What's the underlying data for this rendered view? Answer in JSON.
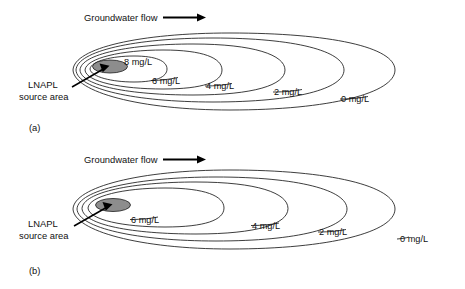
{
  "figure": {
    "type": "diagram",
    "background_color": "#ffffff",
    "line_color": "#1b1b1b",
    "source_fill_color": "#8d8d8d",
    "panels": [
      {
        "letter": "(a)",
        "flow_label": "Groundwater flow",
        "source_label_line1": "LNAPL",
        "source_label_line2": "source area",
        "contours": [
          {
            "label": "8 mg/L",
            "value": 8,
            "unit": "mg/L"
          },
          {
            "label": "6 mg/L",
            "value": 6,
            "unit": "mg/L"
          },
          {
            "label": "4 mg/L",
            "value": 4,
            "unit": "mg/L"
          },
          {
            "label": "2 mg/L",
            "value": 2,
            "unit": "mg/L"
          },
          {
            "label": "0 mg/L",
            "value": 0,
            "unit": "mg/L"
          }
        ]
      },
      {
        "letter": "(b)",
        "flow_label": "Groundwater flow",
        "source_label_line1": "LNAPL",
        "source_label_line2": "source area",
        "contours": [
          {
            "label": "6 mg/L",
            "value": 6,
            "unit": "mg/L"
          },
          {
            "label": "4 mg/L",
            "value": 4,
            "unit": "mg/L"
          },
          {
            "label": "2 mg/L",
            "value": 2,
            "unit": "mg/L"
          },
          {
            "label": "0 mg/L",
            "value": 0,
            "unit": "mg/L"
          }
        ]
      }
    ]
  }
}
